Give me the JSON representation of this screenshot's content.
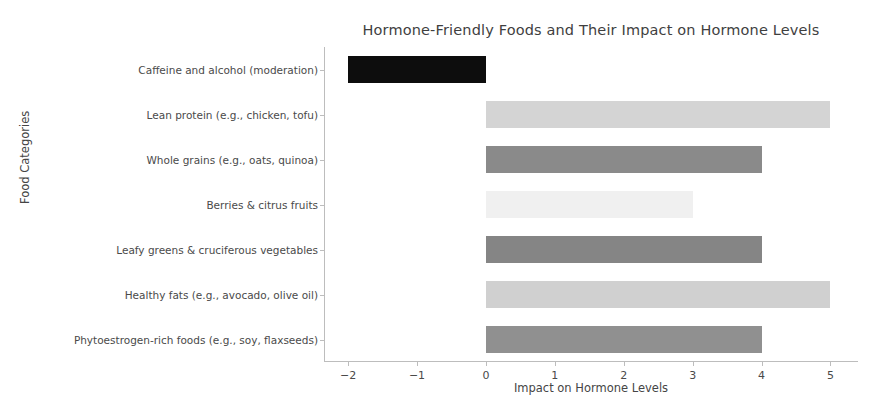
{
  "chart_data": {
    "type": "bar",
    "orientation": "horizontal",
    "title": "Hormone-Friendly Foods and Their Impact on Hormone Levels",
    "xlabel": "Impact on Hormone Levels",
    "ylabel": "Food Categories",
    "categories": [
      "Caffeine and alcohol (moderation)",
      "Lean protein (e.g., chicken, tofu)",
      "Whole grains (e.g., oats, quinoa)",
      "Berries & citrus fruits",
      "Leafy greens & cruciferous vegetables",
      "Healthy fats (e.g., avocado, olive oil)",
      "Phytoestrogen-rich foods (e.g., soy, flaxseeds)"
    ],
    "values": [
      -2,
      5,
      4,
      3,
      4,
      5,
      4
    ],
    "bar_colors": [
      "#0d0d0d",
      "#d4d4d4",
      "#8a8a8a",
      "#f0f0f0",
      "#858585",
      "#d0d0d0",
      "#909090"
    ],
    "xticks": [
      -2,
      -1,
      0,
      1,
      2,
      3,
      4,
      5
    ],
    "xtick_labels": [
      "−2",
      "−1",
      "0",
      "1",
      "2",
      "3",
      "4",
      "5"
    ],
    "xlim": [
      -2.35,
      5.4
    ],
    "grid": false,
    "legend": "none"
  }
}
